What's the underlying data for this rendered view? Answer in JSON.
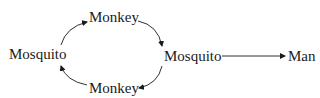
{
  "diagram": {
    "nodes": [
      {
        "id": "monkey_top",
        "label": "Monkey"
      },
      {
        "id": "mosquito_left",
        "label": "Mosquito"
      },
      {
        "id": "monkey_bottom",
        "label": "Monkey"
      },
      {
        "id": "mosquito_right",
        "label": "Mosquito"
      },
      {
        "id": "man",
        "label": "Man"
      }
    ],
    "edges": [
      {
        "from": "mosquito_left",
        "to": "monkey_top"
      },
      {
        "from": "monkey_top",
        "to": "mosquito_right"
      },
      {
        "from": "mosquito_right",
        "to": "monkey_bottom"
      },
      {
        "from": "monkey_bottom",
        "to": "mosquito_left"
      },
      {
        "from": "mosquito_right",
        "to": "man"
      }
    ],
    "colors": {
      "ink": "#1a1a1a",
      "background": "#ffffff"
    }
  }
}
